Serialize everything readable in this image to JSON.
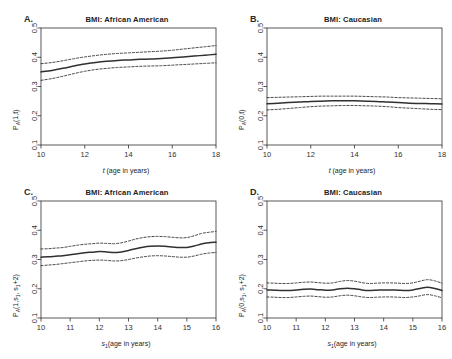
{
  "page_header": {
    "left": "",
    "right": ""
  },
  "panels": [
    {
      "letter": "A.",
      "title": "BMI: African American",
      "ylabel_main": "P",
      "ylabel_sub": "A",
      "ylabel_rest": "(1,t)",
      "xlabel_pre": "t",
      "xlabel_post": " (age in years)"
    },
    {
      "letter": "B.",
      "title": "BMI: Caucasian",
      "ylabel_main": "P",
      "ylabel_sub": "A",
      "ylabel_rest": "(0,t)",
      "xlabel_pre": "t",
      "xlabel_post": " (age in years)"
    },
    {
      "letter": "C.",
      "title": "BMI: African American",
      "ylabel_main": "P",
      "ylabel_sub": "A",
      "ylabel_rest": "(1,s",
      "ylabel_sub2": "1",
      "ylabel_rest2": ", s",
      "ylabel_sub3": "1",
      "ylabel_rest3": "+2)",
      "xlabel_pre": "s",
      "xlabel_sub": "1",
      "xlabel_post": "(age in years)"
    },
    {
      "letter": "D.",
      "title": "BMI: Caucasian",
      "ylabel_main": "P",
      "ylabel_sub": "A",
      "ylabel_rest": "(0,s",
      "ylabel_sub2": "1",
      "ylabel_rest2": ", s",
      "ylabel_sub3": "1",
      "ylabel_rest3": "+2)",
      "xlabel_pre": "s",
      "xlabel_sub": "1",
      "xlabel_post": "(age in years)"
    }
  ],
  "chart_data": [
    {
      "type": "line",
      "panel": "A",
      "title": "BMI: African American",
      "xlabel": "t (age in years)",
      "ylabel": "P_A(1,t)",
      "xlim": [
        10,
        18
      ],
      "ylim": [
        0.1,
        0.5
      ],
      "xticks": [
        10,
        12,
        14,
        16,
        18
      ],
      "yticks": [
        0.1,
        0.2,
        0.3,
        0.4,
        0.5
      ],
      "grid": false,
      "legend": null,
      "x": [
        10,
        10.5,
        11,
        11.5,
        12,
        12.5,
        13,
        13.5,
        14,
        14.5,
        15,
        15.5,
        16,
        16.5,
        17,
        17.5,
        18
      ],
      "series": [
        {
          "name": "estimate",
          "style": "solid",
          "values": [
            0.35,
            0.355,
            0.362,
            0.37,
            0.377,
            0.382,
            0.386,
            0.389,
            0.391,
            0.393,
            0.394,
            0.396,
            0.398,
            0.401,
            0.404,
            0.407,
            0.41
          ]
        },
        {
          "name": "upper 95% CI",
          "style": "dashed",
          "values": [
            0.378,
            0.382,
            0.388,
            0.395,
            0.401,
            0.406,
            0.41,
            0.413,
            0.415,
            0.417,
            0.419,
            0.421,
            0.424,
            0.428,
            0.432,
            0.436,
            0.44
          ]
        },
        {
          "name": "lower 95% CI",
          "style": "dashed",
          "values": [
            0.321,
            0.327,
            0.335,
            0.344,
            0.352,
            0.358,
            0.362,
            0.365,
            0.367,
            0.369,
            0.37,
            0.371,
            0.373,
            0.375,
            0.377,
            0.379,
            0.381
          ]
        }
      ]
    },
    {
      "type": "line",
      "panel": "B",
      "title": "BMI: Caucasian",
      "xlabel": "t (age in years)",
      "ylabel": "P_A(0,t)",
      "xlim": [
        10,
        18
      ],
      "ylim": [
        0.1,
        0.5
      ],
      "xticks": [
        10,
        12,
        14,
        16,
        18
      ],
      "yticks": [
        0.1,
        0.2,
        0.3,
        0.4,
        0.5
      ],
      "grid": false,
      "legend": null,
      "x": [
        10,
        10.5,
        11,
        11.5,
        12,
        12.5,
        13,
        13.5,
        14,
        14.5,
        15,
        15.5,
        16,
        16.5,
        17,
        17.5,
        18
      ],
      "series": [
        {
          "name": "estimate",
          "style": "solid",
          "values": [
            0.241,
            0.243,
            0.245,
            0.247,
            0.249,
            0.25,
            0.251,
            0.251,
            0.251,
            0.25,
            0.249,
            0.247,
            0.245,
            0.243,
            0.242,
            0.241,
            0.24
          ]
        },
        {
          "name": "upper 95% CI",
          "style": "dashed",
          "values": [
            0.262,
            0.263,
            0.264,
            0.265,
            0.266,
            0.267,
            0.267,
            0.267,
            0.267,
            0.266,
            0.265,
            0.264,
            0.262,
            0.261,
            0.26,
            0.259,
            0.258
          ]
        },
        {
          "name": "lower 95% CI",
          "style": "dashed",
          "values": [
            0.22,
            0.222,
            0.225,
            0.228,
            0.231,
            0.233,
            0.234,
            0.235,
            0.235,
            0.234,
            0.233,
            0.231,
            0.228,
            0.226,
            0.224,
            0.222,
            0.221
          ]
        }
      ]
    },
    {
      "type": "line",
      "panel": "C",
      "title": "BMI: African American",
      "xlabel": "s1 (age in years)",
      "ylabel": "P_A(1, s1, s1+2)",
      "xlim": [
        10,
        16
      ],
      "ylim": [
        0.1,
        0.5
      ],
      "xticks": [
        10,
        11,
        12,
        13,
        14,
        15,
        16
      ],
      "yticks": [
        0.1,
        0.2,
        0.3,
        0.4,
        0.5
      ],
      "grid": false,
      "legend": null,
      "x": [
        10,
        10.25,
        10.5,
        10.75,
        11,
        11.25,
        11.5,
        11.75,
        12,
        12.25,
        12.5,
        12.75,
        13,
        13.25,
        13.5,
        13.75,
        14,
        14.25,
        14.5,
        14.75,
        15,
        15.25,
        15.5,
        15.75,
        16
      ],
      "series": [
        {
          "name": "estimate",
          "style": "solid",
          "values": [
            0.308,
            0.309,
            0.311,
            0.313,
            0.316,
            0.32,
            0.323,
            0.325,
            0.327,
            0.326,
            0.324,
            0.326,
            0.331,
            0.337,
            0.342,
            0.345,
            0.346,
            0.345,
            0.343,
            0.341,
            0.341,
            0.346,
            0.353,
            0.357,
            0.359
          ]
        },
        {
          "name": "upper 95% CI",
          "style": "dashed",
          "values": [
            0.336,
            0.337,
            0.339,
            0.341,
            0.345,
            0.349,
            0.352,
            0.354,
            0.356,
            0.355,
            0.354,
            0.357,
            0.363,
            0.37,
            0.375,
            0.378,
            0.379,
            0.378,
            0.376,
            0.374,
            0.375,
            0.381,
            0.389,
            0.393,
            0.396
          ]
        },
        {
          "name": "lower 95% CI",
          "style": "dashed",
          "values": [
            0.279,
            0.281,
            0.283,
            0.286,
            0.289,
            0.292,
            0.295,
            0.297,
            0.298,
            0.297,
            0.295,
            0.296,
            0.3,
            0.305,
            0.309,
            0.312,
            0.313,
            0.312,
            0.31,
            0.308,
            0.308,
            0.312,
            0.318,
            0.322,
            0.324
          ]
        }
      ]
    },
    {
      "type": "line",
      "panel": "D",
      "title": "BMI: Caucasian",
      "xlabel": "s1 (age in years)",
      "ylabel": "P_A(0, s1, s1+2)",
      "xlim": [
        10,
        16
      ],
      "ylim": [
        0.1,
        0.5
      ],
      "xticks": [
        10,
        11,
        12,
        13,
        14,
        15,
        16
      ],
      "yticks": [
        0.1,
        0.2,
        0.3,
        0.4,
        0.5
      ],
      "grid": false,
      "legend": null,
      "x": [
        10,
        10.25,
        10.5,
        10.75,
        11,
        11.25,
        11.5,
        11.75,
        12,
        12.25,
        12.5,
        12.75,
        13,
        13.25,
        13.5,
        13.75,
        14,
        14.25,
        14.5,
        14.75,
        15,
        15.25,
        15.5,
        15.75,
        16
      ],
      "series": [
        {
          "name": "estimate",
          "style": "solid",
          "values": [
            0.196,
            0.195,
            0.194,
            0.194,
            0.196,
            0.198,
            0.199,
            0.197,
            0.195,
            0.196,
            0.2,
            0.202,
            0.2,
            0.196,
            0.194,
            0.195,
            0.196,
            0.196,
            0.195,
            0.194,
            0.196,
            0.201,
            0.205,
            0.201,
            0.194
          ]
        },
        {
          "name": "upper 95% CI",
          "style": "dashed",
          "values": [
            0.22,
            0.219,
            0.218,
            0.218,
            0.22,
            0.222,
            0.223,
            0.221,
            0.219,
            0.22,
            0.225,
            0.228,
            0.226,
            0.221,
            0.218,
            0.219,
            0.22,
            0.22,
            0.219,
            0.218,
            0.22,
            0.226,
            0.231,
            0.227,
            0.219
          ]
        },
        {
          "name": "lower 95% CI",
          "style": "dashed",
          "values": [
            0.172,
            0.171,
            0.17,
            0.17,
            0.172,
            0.174,
            0.175,
            0.173,
            0.171,
            0.172,
            0.176,
            0.178,
            0.176,
            0.172,
            0.17,
            0.171,
            0.172,
            0.172,
            0.171,
            0.17,
            0.172,
            0.176,
            0.18,
            0.176,
            0.169
          ]
        }
      ]
    }
  ]
}
